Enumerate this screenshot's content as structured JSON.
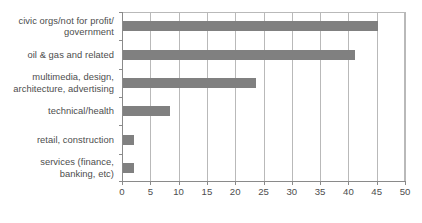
{
  "chart_data": {
    "type": "bar",
    "orientation": "horizontal",
    "title": "",
    "subtitle": "",
    "xlabel": "",
    "ylabel": "",
    "categories": [
      "civic orgs/not for profit/\ngovernment",
      "oil & gas and related",
      "multimedia, design,\narchitecture, advertising",
      "technical/health",
      "retail, construction",
      "services (finance,\nbanking, etc)"
    ],
    "values": [
      45,
      41,
      23.5,
      8.3,
      2,
      2
    ],
    "xlim": [
      0,
      50
    ],
    "xticks": [
      0,
      5,
      10,
      15,
      20,
      25,
      30,
      35,
      40,
      45,
      50
    ],
    "xtick_labels": [
      "0",
      "5",
      "10",
      "15",
      "20",
      "25",
      "30",
      "35",
      "40",
      "45",
      "50"
    ],
    "grid": "vertical",
    "legend": null,
    "bar_color": "#808080",
    "grid_color": "#b9b9b9",
    "axis_color": "#8a8a8a",
    "text_color": "#4d4d4d",
    "background": "#ffffff"
  }
}
